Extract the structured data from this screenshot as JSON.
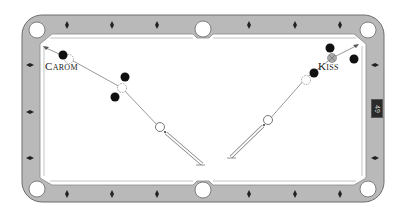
{
  "diagram": {
    "type": "billiard-shot-diagram",
    "table": {
      "rail_color": "#b9b9b9",
      "rail_outline": "#6e6e6e",
      "felt_color": "#ffffff",
      "pocket_color": "#ffffff",
      "diamond_color": "#222222",
      "pockets": [
        {
          "name": "top-left",
          "x": 37,
          "y": 30
        },
        {
          "name": "top-middle",
          "x": 203,
          "y": 29
        },
        {
          "name": "top-right",
          "x": 368,
          "y": 30
        },
        {
          "name": "bottom-left",
          "x": 37,
          "y": 189
        },
        {
          "name": "bottom-middle",
          "x": 203,
          "y": 190
        },
        {
          "name": "bottom-right",
          "x": 368,
          "y": 189
        }
      ]
    },
    "shots": [
      {
        "name": "carom",
        "label": "Carom",
        "label_pos": {
          "x": 46,
          "y": 66
        },
        "cue_stick": {
          "from": [
            201,
            165
          ],
          "to": [
            165,
            133
          ]
        },
        "cue_ball": {
          "x": 160,
          "y": 128
        },
        "path": [
          [
            160,
            128
          ],
          [
            122,
            88
          ],
          [
            66,
            57
          ],
          [
            44,
            47
          ]
        ],
        "ghost_balls": [
          {
            "x": 122,
            "y": 88
          },
          {
            "x": 69,
            "y": 59
          }
        ],
        "object_balls": [
          {
            "x": 125,
            "y": 77,
            "style": "black"
          },
          {
            "x": 115,
            "y": 97,
            "style": "black"
          },
          {
            "x": 63,
            "y": 55,
            "style": "black"
          }
        ]
      },
      {
        "name": "kiss",
        "label": "Kiss",
        "label_pos": {
          "x": 318,
          "y": 66
        },
        "cue_stick": {
          "from": [
            230,
            158
          ],
          "to": [
            264,
            125
          ]
        },
        "cue_ball": {
          "x": 268,
          "y": 121
        },
        "path": [
          [
            268,
            121
          ],
          [
            305,
            79
          ],
          [
            332,
            58
          ],
          [
            358,
            45
          ]
        ],
        "ghost_balls": [
          {
            "x": 306,
            "y": 80
          }
        ],
        "object_balls": [
          {
            "x": 314,
            "y": 73,
            "style": "black"
          },
          {
            "x": 332,
            "y": 58,
            "style": "hatched"
          },
          {
            "x": 330,
            "y": 48,
            "style": "black"
          },
          {
            "x": 354,
            "y": 59,
            "style": "black"
          }
        ]
      }
    ],
    "page_tag": "49"
  }
}
